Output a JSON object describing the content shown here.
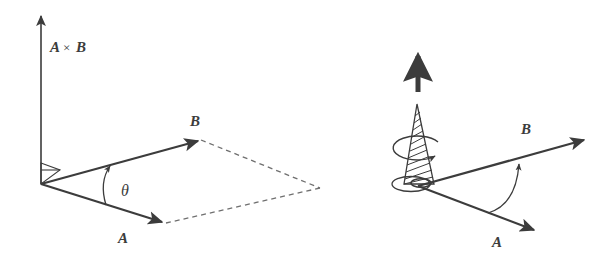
{
  "figure": {
    "background_color": "#ffffff",
    "ink_color": "#3c3c3c",
    "dash_color": "#6f6f6f"
  },
  "panels": [
    {
      "id": "left-panel",
      "name": "cross-product-parallelogram",
      "labels": {
        "cross_product_first": "A",
        "cross_product_times": "×",
        "cross_product_second": "B",
        "vector_a": "A",
        "vector_b": "B",
        "angle": "θ"
      },
      "elements": {
        "vertical_axis": "A×B vector pointing up from origin",
        "right_angle_marker": "right angle between A×B and the plane",
        "vector_a_arrow": "A vector in plane pointing down-right",
        "vector_b_arrow": "B vector in plane pointing up-right",
        "angle_arc": "theta arc from A to B",
        "parallelogram_dashed": "dashed completion of parallelogram"
      }
    },
    {
      "id": "right-panel",
      "name": "right-hand-screw-rule",
      "labels": {
        "vector_a": "A",
        "vector_b": "B"
      },
      "elements": {
        "up_arrow": "thick arrow showing screw advance direction",
        "screw_cone": "hatched conical screw at origin",
        "rotation_arrow": "circular arrow showing rotation from A to B",
        "vector_a_arrow": "A vector pointing down-right",
        "vector_b_arrow": "B vector pointing up-right",
        "angle_arc_arrow": "curved arrow sweeping from A to B"
      }
    }
  ]
}
